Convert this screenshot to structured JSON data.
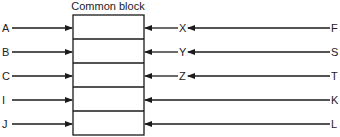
{
  "diagram": {
    "title": "Common block",
    "block": {
      "x": 73,
      "y": 15,
      "width": 71,
      "height": 120,
      "rows": 5
    },
    "left_inputs": [
      "A",
      "B",
      "C",
      "I",
      "J"
    ],
    "right_middle_labels": [
      "X",
      "Y",
      "Z",
      "",
      ""
    ],
    "right_sources": [
      "F",
      "S",
      "T",
      "K",
      "L"
    ],
    "row_centers": [
      28,
      52,
      76,
      100,
      124
    ],
    "line_color": "#1a1a1a"
  }
}
